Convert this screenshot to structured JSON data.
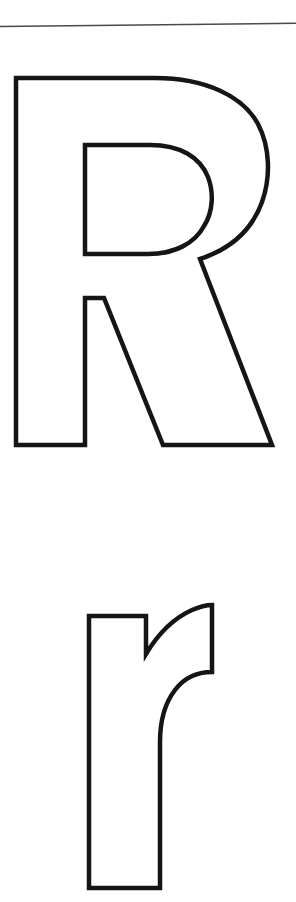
{
  "page": {
    "kind": "letter-tracing-worksheet",
    "background_color": "#ffffff",
    "width": 296,
    "height": 902,
    "title": "Letter R tracing worksheet page"
  },
  "divider": {
    "name": "horizontal-rule",
    "color": "#4a4a4a",
    "thickness_px": 1.5,
    "left_y": 26,
    "right_y": 23,
    "label": "horizontal rule"
  },
  "glyphs": [
    {
      "id": "uppercase-r",
      "character": "R",
      "case": "uppercase",
      "style": "outline",
      "stroke_color": "#151515",
      "fill_color": "#ffffff",
      "stroke_width_px": 4.5,
      "bounds": {
        "x": 16,
        "y": 78,
        "width": 256,
        "height": 369
      },
      "label": "Capital letter R outline"
    },
    {
      "id": "lowercase-r",
      "character": "r",
      "case": "lowercase",
      "style": "outline",
      "stroke_color": "#151515",
      "fill_color": "#ffffff",
      "stroke_width_px": 4.5,
      "bounds": {
        "x": 88,
        "y": 604,
        "width": 125,
        "height": 285
      },
      "label": "Small letter r outline"
    }
  ]
}
